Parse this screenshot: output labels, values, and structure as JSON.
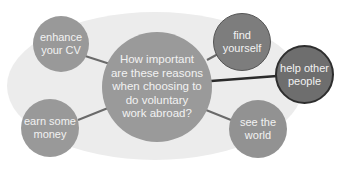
{
  "diagram": {
    "type": "mind-map",
    "background": {
      "color": "#ececec"
    },
    "center": {
      "text": "How important are these reasons when choosing to do voluntary work abroad?",
      "lines": [
        "How important",
        "are these reasons",
        "when choosing to",
        "do voluntary",
        "work abroad?"
      ],
      "color": "#9a9a9a"
    },
    "nodes": [
      {
        "id": "enhance-your-cv",
        "lines": [
          "enhance",
          "your CV"
        ],
        "color": "#999999"
      },
      {
        "id": "find-yourself",
        "lines": [
          "find",
          "yourself"
        ],
        "color": "#7d7d7d"
      },
      {
        "id": "help-other-people",
        "lines": [
          "help other",
          "people"
        ],
        "color": "#6e6e6e",
        "border": "#2e2e2e"
      },
      {
        "id": "earn-some-money",
        "lines": [
          "earn some",
          "money"
        ],
        "color": "#999999"
      },
      {
        "id": "see-the-world",
        "lines": [
          "see the",
          "world"
        ],
        "color": "#929292"
      }
    ],
    "connector_color": "#6a6a6a",
    "emphasis_connector_color": "#2a2a2a"
  }
}
